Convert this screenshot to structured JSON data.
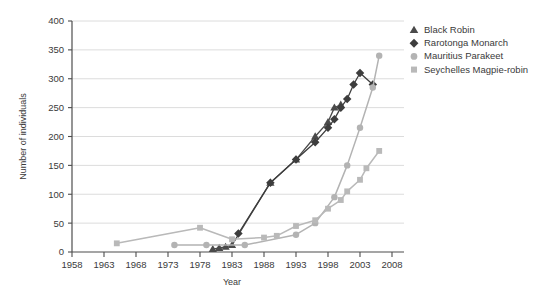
{
  "chart_data": {
    "type": "line",
    "title": "",
    "xlabel": "Year",
    "ylabel": "Number of individuals",
    "xlim": [
      1958,
      2008
    ],
    "ylim": [
      0,
      400
    ],
    "xticks": [
      1958,
      1963,
      1968,
      1973,
      1978,
      1983,
      1988,
      1993,
      1998,
      2003,
      2008
    ],
    "yticks": [
      0,
      50,
      100,
      150,
      200,
      250,
      300,
      350,
      400
    ],
    "grid": "horizontal",
    "legend_position": "top-right",
    "series": [
      {
        "name": "Black Robin",
        "marker": "triangle",
        "color": "#4a4a4a",
        "points": [
          [
            1980,
            5
          ],
          [
            1981,
            7
          ],
          [
            1982,
            9
          ],
          [
            1983,
            12
          ],
          [
            1989,
            120
          ],
          [
            1993,
            160
          ],
          [
            1996,
            200
          ],
          [
            1998,
            225
          ],
          [
            1999,
            250
          ],
          [
            2000,
            255
          ]
        ]
      },
      {
        "name": "Rarotonga Monarch",
        "marker": "diamond",
        "color": "#3d3d3d",
        "points": [
          [
            1984,
            32
          ],
          [
            1989,
            120
          ],
          [
            1993,
            160
          ],
          [
            1996,
            190
          ],
          [
            1998,
            215
          ],
          [
            1999,
            230
          ],
          [
            2000,
            250
          ],
          [
            2001,
            265
          ],
          [
            2002,
            290
          ],
          [
            2003,
            310
          ],
          [
            2005,
            290
          ]
        ]
      },
      {
        "name": "Mauritius Parakeet",
        "marker": "circle",
        "color": "#b3b3b3",
        "points": [
          [
            1974,
            12
          ],
          [
            1979,
            12
          ],
          [
            1985,
            12
          ],
          [
            1993,
            30
          ],
          [
            1996,
            50
          ],
          [
            1999,
            95
          ],
          [
            2001,
            150
          ],
          [
            2003,
            215
          ],
          [
            2005,
            285
          ],
          [
            2006,
            340
          ]
        ]
      },
      {
        "name": "Seychelles Magpie-robin",
        "marker": "square",
        "color": "#b9b9b9",
        "points": [
          [
            1965,
            15
          ],
          [
            1978,
            42
          ],
          [
            1983,
            22
          ],
          [
            1988,
            25
          ],
          [
            1990,
            28
          ],
          [
            1993,
            45
          ],
          [
            1996,
            55
          ],
          [
            1998,
            75
          ],
          [
            2000,
            90
          ],
          [
            2001,
            105
          ],
          [
            2003,
            125
          ],
          [
            2004,
            145
          ],
          [
            2006,
            175
          ]
        ]
      }
    ]
  },
  "legend": {
    "items": [
      {
        "label": "Black Robin",
        "marker": "triangle",
        "color": "#4a4a4a"
      },
      {
        "label": "Rarotonga Monarch",
        "marker": "diamond",
        "color": "#3d3d3d"
      },
      {
        "label": "Mauritius Parakeet",
        "marker": "circle",
        "color": "#b3b3b3"
      },
      {
        "label": "Seychelles Magpie-robin",
        "marker": "square",
        "color": "#b9b9b9"
      }
    ]
  },
  "style": {
    "grid_color": "#d8d8d8",
    "axis_color": "#4d4d4d",
    "text_color": "#3a3a3a",
    "background": "#ffffff"
  }
}
